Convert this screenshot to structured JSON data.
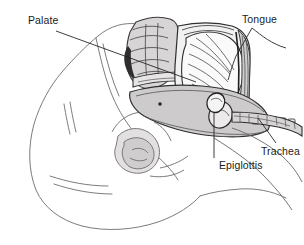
{
  "figure": {
    "background_color": "#ffffff",
    "line_color": "#2b2b2b",
    "label_color": "#1b1b1b",
    "shade_light": "#eceaea",
    "shade_mid": "#d9d7d7",
    "shade_dark": "#bdbbbb"
  },
  "labels": [
    {
      "id": "palate",
      "text": "Palate",
      "leader": "line-from-label-to-hard-palate"
    },
    {
      "id": "tongue",
      "text": "Tongue",
      "leader": "line-from-label-to-tongue-body"
    },
    {
      "id": "epiglottis",
      "text": "Epiglottis",
      "leader": "vertical-line-from-label-to-epiglottis"
    },
    {
      "id": "trachea",
      "text": "Trachea",
      "leader": "diagonal-line-from-label-to-trachea"
    }
  ],
  "structures": [
    "head-outline",
    "ear",
    "nasal-cavity",
    "hard-palate",
    "soft-palate",
    "oral-cavity",
    "tongue",
    "teeth",
    "mandible",
    "pharynx",
    "epiglottis",
    "larynx",
    "trachea",
    "neck-contour"
  ]
}
